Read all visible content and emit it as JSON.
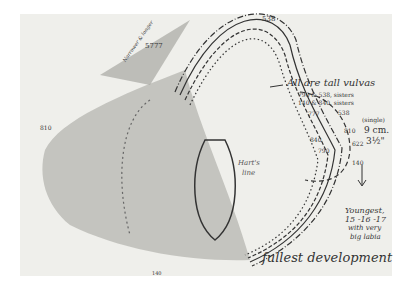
{
  "figure": {
    "kind": "hand-drawn anatomical outline comparison (historical sexology study sketch)",
    "annotations": {
      "top_number": "538",
      "upper_left_number": "5777",
      "upper_left_note": "Narrower & longer",
      "all_tall": "All are tall vulvas",
      "sisters_line1": "790 & 538, sisters",
      "sisters_line2": "140 & 840, sisters",
      "num_538_right": "538",
      "num_777": "777",
      "num_810_right": "810",
      "num_840": "840",
      "num_790": "790",
      "num_622": "622",
      "num_140_right": "140",
      "num_810_left": "810",
      "num_140_bottom": "140",
      "center_label_1": "Hart's",
      "center_label_2": "line",
      "single": "(single)",
      "measure_cm": "9 cm.",
      "measure_in": "3½\"",
      "youngest_1": "Youngest,",
      "youngest_2": "15 -16 -17",
      "youngest_3": "with very",
      "youngest_4": "big labia",
      "caption": "fullest development"
    },
    "colors": {
      "paper": "#efefeb",
      "ink": "#333333",
      "shading": "#9a9a96"
    }
  }
}
